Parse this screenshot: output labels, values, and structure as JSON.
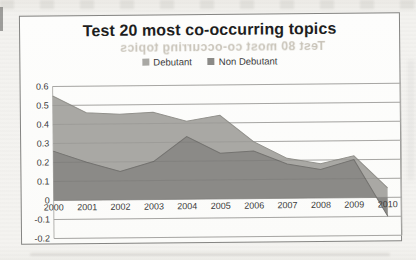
{
  "chart_data": {
    "type": "area",
    "mode": "overlap",
    "title": "Test 20 most co-occurring topics",
    "categories": [
      "2000",
      "2001",
      "2002",
      "2003",
      "2004",
      "2005",
      "2006",
      "2007",
      "2008",
      "2009",
      "2010"
    ],
    "series": [
      {
        "name": "Debutant",
        "color": "#a9a8a4",
        "edge_color": "#92918c",
        "values": [
          0.55,
          0.46,
          0.45,
          0.46,
          0.41,
          0.44,
          0.3,
          0.21,
          0.18,
          0.22,
          0.05
        ]
      },
      {
        "name": "Non Debutant",
        "color": "#8b8a87",
        "edge_color": "#747370",
        "values": [
          0.26,
          0.2,
          0.15,
          0.2,
          0.33,
          0.24,
          0.25,
          0.18,
          0.15,
          0.2,
          -0.1
        ]
      }
    ],
    "ylim": [
      -0.2,
      0.6
    ],
    "y_ticks": [
      "0.6",
      "0.5",
      "0.4",
      "0.3",
      "0.2",
      "0.1",
      "0",
      "-0.1",
      "-0.2"
    ],
    "grid": true,
    "legend_position": "top",
    "gridline_color": "#b4b3b0"
  },
  "artifacts": {
    "showthrough_title": "Test 80 most co-occurring topics"
  }
}
